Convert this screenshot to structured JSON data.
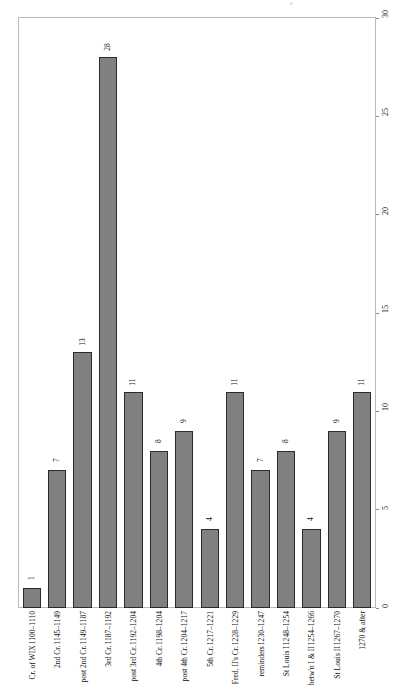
{
  "chart_data": {
    "type": "bar",
    "title": "",
    "subtitle": "",
    "xlabel": "",
    "ylabel": "",
    "ylim": [
      0,
      30
    ],
    "yticks": [
      0,
      5,
      10,
      15,
      20,
      25,
      30
    ],
    "grid": false,
    "legend": null,
    "axis_position": {
      "y_axis": "right",
      "x_axis": "bottom"
    },
    "label_rotation_deg": -90,
    "bar_color": "#808080",
    "bar_border_color": "#2b2b2b",
    "frame_color": "#b9b9b9",
    "categories": [
      "1100–1110 Cr. of WIX",
      "1145–1149 2nd Cr.",
      "1149–1187 post 2nd Cr.",
      "1187–1192 3rd Cr.",
      "1192–1204 post 3rd Cr.",
      "1198–1204 4th Cr.",
      "1204–1217 post 4th Cr.",
      "1217–1221 5th Cr.",
      "1228–1229 Fred. II's Cr.",
      "1230–1247 reminders",
      "1248–1254 St Louis I",
      "1254–1266 betw'n I & II",
      "1267–1270 St Louis II",
      "1270 & after"
    ],
    "category_lines": [
      [
        "1100–1110",
        "Cr. of WIX"
      ],
      [
        "1145–1149",
        "2nd Cr."
      ],
      [
        "1149–1187",
        "post 2nd Cr."
      ],
      [
        "1187–1192",
        "3rd Cr."
      ],
      [
        "1192–1204",
        "post 3rd Cr."
      ],
      [
        "1198–1204",
        "4th Cr."
      ],
      [
        "1204–1217",
        "post 4th Cr."
      ],
      [
        "1217–1221",
        "5th Cr."
      ],
      [
        "1228–1229",
        "Fred. II's Cr."
      ],
      [
        "1230–1247",
        "reminders"
      ],
      [
        "1248–1254",
        "St Louis I"
      ],
      [
        "1254–1266",
        "betw'n I & II"
      ],
      [
        "1267–1270",
        "St Louis II"
      ],
      [
        "1270 & after",
        ""
      ]
    ],
    "values": [
      1,
      7,
      13,
      28,
      11,
      8,
      9,
      4,
      11,
      7,
      8,
      4,
      9,
      11
    ]
  }
}
